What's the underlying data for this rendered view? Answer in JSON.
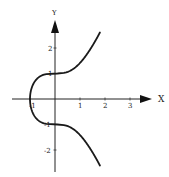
{
  "chart_data": {
    "type": "line",
    "title": "",
    "equation": "y^2 = x^3 + 1",
    "xlabel": "X",
    "ylabel": "Y",
    "xlim": [
      -1.7,
      3.9
    ],
    "ylim": [
      -2.9,
      3.2
    ],
    "x_ticks": [
      -1,
      1,
      2,
      3
    ],
    "x_tick_labels": [
      "-1",
      "1",
      "2",
      "3"
    ],
    "y_ticks": [
      2,
      1,
      -1,
      -2
    ],
    "y_tick_labels": [
      "2",
      "1",
      "-1",
      "-2"
    ],
    "grid": false,
    "legend": null,
    "series": [
      {
        "name": "upper branch",
        "x": [
          -1,
          -0.9,
          -0.75,
          -0.5,
          -0.25,
          0,
          0.25,
          0.5,
          0.75,
          1,
          1.25,
          1.5,
          1.8
        ],
        "y": [
          0,
          0.52,
          0.76,
          0.94,
          0.99,
          1,
          1.01,
          1.06,
          1.19,
          1.41,
          1.68,
          2.03,
          2.61
        ]
      },
      {
        "name": "lower branch",
        "x": [
          -1,
          -0.9,
          -0.75,
          -0.5,
          -0.25,
          0,
          0.25,
          0.5,
          0.75,
          1,
          1.25,
          1.5,
          1.8
        ],
        "y": [
          0,
          -0.52,
          -0.76,
          -0.94,
          -0.99,
          -1,
          -1.01,
          -1.06,
          -1.19,
          -1.41,
          -1.68,
          -2.03,
          -2.61
        ]
      }
    ],
    "stroke_color": "#1a1a1a"
  }
}
